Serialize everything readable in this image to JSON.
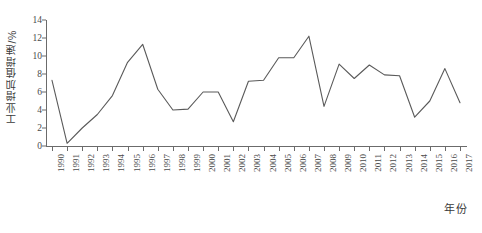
{
  "chart_data": {
    "type": "line",
    "title": "",
    "xlabel": "年份",
    "ylabel": "工业增加值增速/%",
    "categories": [
      "1990",
      "1991",
      "1992",
      "1993",
      "1994",
      "1995",
      "1996",
      "1997",
      "1998",
      "1999",
      "2000",
      "2001",
      "2002",
      "2003",
      "2004",
      "2005",
      "2006",
      "2007",
      "2008",
      "2009",
      "2010",
      "2011",
      "2012",
      "2013",
      "2014",
      "2015",
      "2016",
      "2017"
    ],
    "values": [
      7.3,
      0.3,
      2.0,
      3.5,
      5.6,
      9.3,
      11.3,
      6.3,
      4.0,
      4.1,
      6.0,
      6.0,
      2.7,
      7.2,
      7.3,
      9.8,
      9.8,
      12.2,
      4.4,
      9.1,
      7.5,
      9.0,
      7.9,
      7.8,
      3.2,
      5.0,
      8.6,
      4.8
    ],
    "series": [
      {
        "name": "工业增加值增速",
        "color": "#5a5a5a",
        "values": [
          7.3,
          0.3,
          2.0,
          3.5,
          5.6,
          9.3,
          11.3,
          6.3,
          4.0,
          4.1,
          6.0,
          6.0,
          2.7,
          7.2,
          7.3,
          9.8,
          9.8,
          12.2,
          4.4,
          9.1,
          7.5,
          9.0,
          7.9,
          7.8,
          3.2,
          5.0,
          8.6,
          4.8
        ]
      }
    ],
    "ylim": [
      0,
      14
    ],
    "yticks": [
      0,
      2,
      4,
      6,
      8,
      10,
      12,
      14
    ],
    "ytick_labels": [
      "0",
      "2",
      "4",
      "6",
      "8",
      "10",
      "12",
      "14"
    ],
    "grid": false,
    "legend": "none",
    "line_color": "#5a5a5a",
    "axis_color": "#6b6b6b",
    "background": "#ffffff"
  }
}
